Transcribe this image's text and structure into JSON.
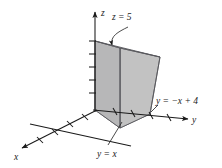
{
  "figure": {
    "kind": "3d-coordinate-diagram",
    "background_color": "#ffffff",
    "axes": [
      {
        "id": "x",
        "label": "x",
        "direction": "down-left",
        "tick_count": 4,
        "arrowhead": true
      },
      {
        "id": "y",
        "label": "y",
        "direction": "right",
        "tick_count": 4,
        "arrowhead": true
      },
      {
        "id": "z",
        "label": "z",
        "direction": "up",
        "tick_count": 6,
        "arrowhead": true
      }
    ],
    "annotations": [
      {
        "id": "plane-z",
        "text": "z = 5",
        "pointer": "curved-arrow",
        "target": "top-face"
      },
      {
        "id": "plane-y-neg-x-plus-4",
        "text": "y = −x + 4",
        "pointer": "leader-line",
        "target": "right-face"
      },
      {
        "id": "plane-y-eq-x",
        "text": "y = x",
        "pointer": "leader-line",
        "target": "base-edge"
      }
    ],
    "solid": {
      "name": "triangular-prism",
      "face_colors": {
        "top": "#a9a9ab",
        "front_left": "#b9b9ba",
        "front_right": "#c3c3c3",
        "base": "#9e9ea0"
      },
      "edge_color": "#55555a"
    }
  }
}
